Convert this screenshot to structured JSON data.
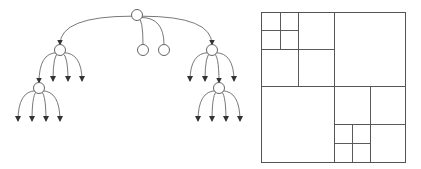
{
  "figure": {
    "width": 421,
    "height": 169,
    "stroke_color": "#555555",
    "fill_color": "#ffffff"
  },
  "tree": {
    "node_radius": 5.5,
    "nodes": [
      {
        "id": "root",
        "x": 137,
        "y": 15
      },
      {
        "id": "left",
        "x": 60,
        "y": 50
      },
      {
        "id": "mid1",
        "x": 143,
        "y": 50
      },
      {
        "id": "mid2",
        "x": 164,
        "y": 50
      },
      {
        "id": "right",
        "x": 212,
        "y": 50
      },
      {
        "id": "left-left",
        "x": 39,
        "y": 88
      },
      {
        "id": "right-mid",
        "x": 219,
        "y": 88
      }
    ],
    "node_edges": [
      {
        "from": "root",
        "to": "left",
        "arrow": true
      },
      {
        "from": "root",
        "to": "mid1",
        "arrow": false
      },
      {
        "from": "root",
        "to": "mid2",
        "arrow": false
      },
      {
        "from": "root",
        "to": "right",
        "arrow": true
      },
      {
        "from": "left",
        "to": "left-left",
        "arrow": true
      },
      {
        "from": "right",
        "to": "right-mid",
        "arrow": true
      }
    ],
    "leaf_arrows": [
      {
        "from": "left",
        "to_x": 53,
        "to_y": 81
      },
      {
        "from": "left",
        "to_x": 68,
        "to_y": 81
      },
      {
        "from": "left",
        "to_x": 82,
        "to_y": 81
      },
      {
        "from": "left-left",
        "to_x": 18,
        "to_y": 121
      },
      {
        "from": "left-left",
        "to_x": 32,
        "to_y": 121
      },
      {
        "from": "left-left",
        "to_x": 46,
        "to_y": 121
      },
      {
        "from": "left-left",
        "to_x": 60,
        "to_y": 121
      },
      {
        "from": "right",
        "to_x": 190,
        "to_y": 81
      },
      {
        "from": "right",
        "to_x": 205,
        "to_y": 81
      },
      {
        "from": "right",
        "to_x": 234,
        "to_y": 81
      },
      {
        "from": "right-mid",
        "to_x": 198,
        "to_y": 121
      },
      {
        "from": "right-mid",
        "to_x": 212,
        "to_y": 121
      },
      {
        "from": "right-mid",
        "to_x": 226,
        "to_y": 121
      },
      {
        "from": "right-mid",
        "to_x": 240,
        "to_y": 121
      }
    ]
  },
  "quadtree": {
    "outer": {
      "x": 261,
      "y": 12,
      "w": 144,
      "h": 150
    },
    "cells": [
      {
        "x": 261,
        "y": 12,
        "w": 73,
        "h": 74
      },
      {
        "x": 334,
        "y": 12,
        "w": 71,
        "h": 74
      },
      {
        "x": 261,
        "y": 86,
        "w": 73,
        "h": 76
      },
      {
        "x": 334,
        "y": 86,
        "w": 71,
        "h": 76
      },
      {
        "x": 261,
        "y": 12,
        "w": 37,
        "h": 37
      },
      {
        "x": 298,
        "y": 12,
        "w": 36,
        "h": 37
      },
      {
        "x": 261,
        "y": 49,
        "w": 37,
        "h": 37
      },
      {
        "x": 298,
        "y": 49,
        "w": 36,
        "h": 37
      },
      {
        "x": 261,
        "y": 12,
        "w": 19,
        "h": 18
      },
      {
        "x": 280,
        "y": 12,
        "w": 18,
        "h": 18
      },
      {
        "x": 261,
        "y": 30,
        "w": 19,
        "h": 19
      },
      {
        "x": 280,
        "y": 30,
        "w": 18,
        "h": 19
      },
      {
        "x": 334,
        "y": 86,
        "w": 36,
        "h": 38
      },
      {
        "x": 370,
        "y": 86,
        "w": 35,
        "h": 38
      },
      {
        "x": 334,
        "y": 124,
        "w": 36,
        "h": 38
      },
      {
        "x": 370,
        "y": 124,
        "w": 35,
        "h": 38
      },
      {
        "x": 334,
        "y": 124,
        "w": 18,
        "h": 19
      },
      {
        "x": 352,
        "y": 124,
        "w": 18,
        "h": 19
      },
      {
        "x": 334,
        "y": 143,
        "w": 18,
        "h": 19
      },
      {
        "x": 352,
        "y": 143,
        "w": 18,
        "h": 19
      }
    ]
  }
}
